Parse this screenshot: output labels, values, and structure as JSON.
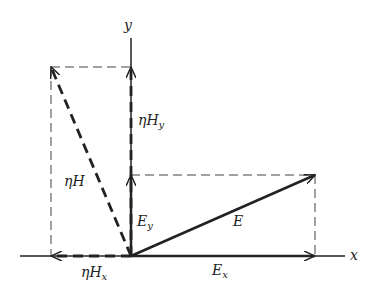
{
  "diagram": {
    "axes": {
      "x_label": "x",
      "y_label": "y"
    },
    "vectors": {
      "E": {
        "label": "E",
        "components": [
          1.0,
          0.44
        ]
      },
      "Ex": {
        "label": "E",
        "sub": "x"
      },
      "Ey": {
        "label": "E",
        "sub": "y"
      },
      "etaH": {
        "label": "ηH",
        "components": [
          -0.44,
          1.0
        ]
      },
      "etaHx": {
        "label": "ηH",
        "sub": "x"
      },
      "etaHy": {
        "label": "ηH",
        "sub": "y"
      }
    },
    "colors": {
      "ink": "#222222",
      "dashed": "#444444",
      "background": "#ffffff"
    }
  }
}
